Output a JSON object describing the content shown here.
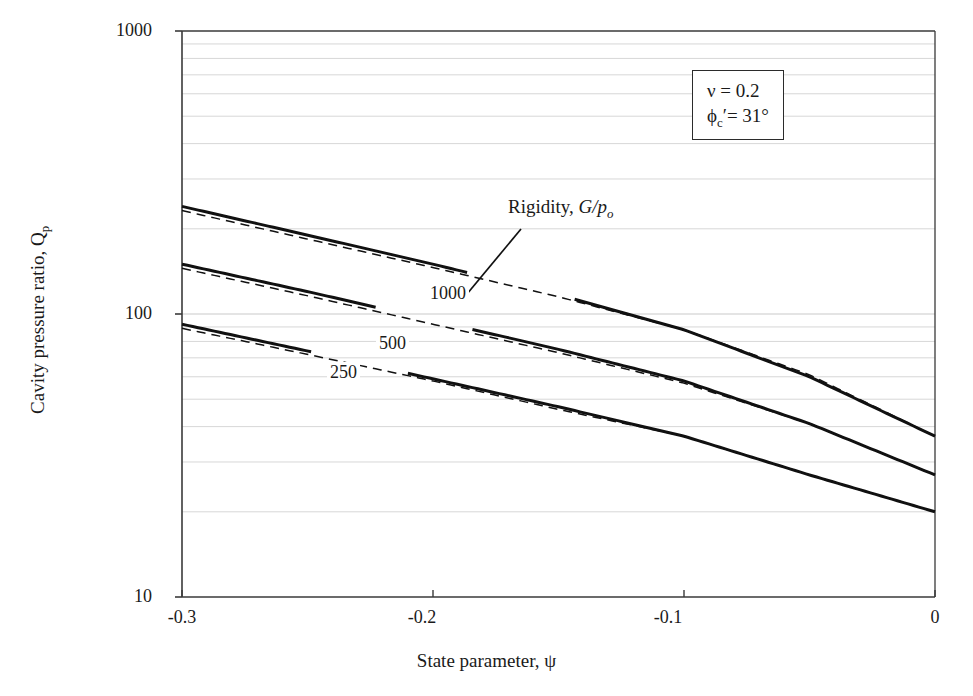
{
  "chart_data": {
    "type": "line",
    "title": "",
    "xlabel": "State parameter, ψ",
    "ylabel": "Cavity pressure ratio, Q",
    "ylabel_sub": "p",
    "xlim": [
      -0.3,
      0.0
    ],
    "ylim": [
      10,
      1000
    ],
    "yscale": "log",
    "xscale": "linear",
    "grid": "horizontal-minor-log",
    "legend": "none",
    "xticks": [
      "-0.3",
      "-0.2",
      "-0.1",
      "0"
    ],
    "xtick_values": [
      -0.3,
      -0.2,
      -0.1,
      0
    ],
    "yticks": [
      "10",
      "100",
      "1000"
    ],
    "ytick_values": [
      10,
      100,
      1000
    ],
    "series": [
      {
        "name": "1000",
        "style": "solid",
        "label": "1000",
        "x": [
          -0.3,
          -0.25,
          -0.2,
          -0.15,
          -0.1,
          -0.05,
          0.0
        ],
        "values": [
          240,
          190,
          150,
          117,
          88,
          60,
          37
        ]
      },
      {
        "name": "1000-approx",
        "style": "dashed",
        "label": "",
        "x": [
          -0.3,
          -0.25,
          -0.2,
          -0.15,
          -0.1,
          -0.05,
          0.0
        ],
        "values": [
          232,
          184,
          146,
          115,
          88,
          61,
          37
        ]
      },
      {
        "name": "500",
        "style": "solid",
        "label": "500",
        "x": [
          -0.3,
          -0.25,
          -0.2,
          -0.15,
          -0.1,
          -0.05,
          0.0
        ],
        "values": [
          150,
          120,
          95,
          75,
          58,
          41,
          27
        ]
      },
      {
        "name": "500-approx",
        "style": "dashed",
        "label": "",
        "x": [
          -0.3,
          -0.25,
          -0.2,
          -0.15,
          -0.1,
          -0.05,
          0.0
        ],
        "values": [
          145,
          116,
          92,
          73,
          57,
          41,
          27
        ]
      },
      {
        "name": "250",
        "style": "solid",
        "label": "250",
        "x": [
          -0.3,
          -0.25,
          -0.2,
          -0.15,
          -0.1,
          -0.05,
          0.0
        ],
        "values": [
          92,
          74,
          59,
          47,
          37,
          27,
          20
        ]
      },
      {
        "name": "250-approx",
        "style": "dashed",
        "label": "",
        "x": [
          -0.3,
          -0.25,
          -0.2,
          -0.15,
          -0.1,
          -0.05,
          0.0
        ],
        "values": [
          89,
          72,
          58,
          46,
          37,
          27,
          20
        ]
      }
    ],
    "annotations": [
      {
        "name": "rigidity-callout",
        "text_plain": "Rigidity, G/p",
        "text_sub": "o",
        "leader_from": [
          462,
          300
        ],
        "leader_to": [
          521,
          229
        ]
      }
    ],
    "parameter_box": {
      "line1_symbol": "ν",
      "line1": "ν = 0.2",
      "line2_symbol": "ϕ",
      "line2_sub": "c",
      "line2": "ϕ′ = 31°",
      "line2_value": "= 31°",
      "line2_prime": "′"
    }
  },
  "colors": {
    "curve": "#111111",
    "grid": "#c9c9c9",
    "axis": "#3a3a3a",
    "background": "#ffffff",
    "text": "#1a1a1a"
  },
  "axis_titles": {
    "x": "State parameter, ψ",
    "y_main": "Cavity pressure ratio, Q"
  },
  "curve_labels": {
    "c1000": "1000",
    "c500": "500",
    "c250": "250"
  },
  "tick_labels": {
    "y_top": "1000",
    "y_mid": "100",
    "y_bot": "10",
    "x0": "-0.3",
    "x1": "-0.2",
    "x2": "-0.1",
    "x3": "0"
  },
  "annotation": {
    "rigidity_text": "Rigidity, ",
    "rigidity_symbol": "G/p",
    "rigidity_sub": "o"
  },
  "param_box": {
    "nu_line": "ν = 0.2",
    "phi_symbol": "ϕ",
    "phi_sub": "c",
    "phi_prime": "′",
    "phi_rest": "= 31°"
  }
}
